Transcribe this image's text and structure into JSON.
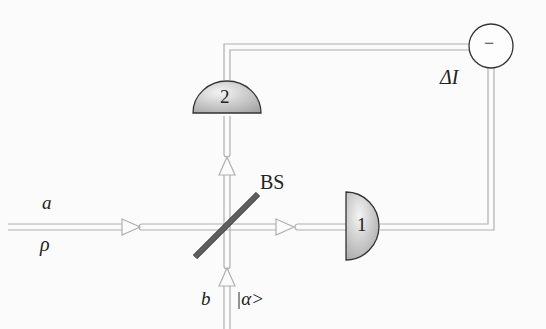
{
  "diagram": {
    "labels": {
      "input_a": "a",
      "input_rho": "ρ",
      "input_b": "b",
      "input_alpha": "|α>",
      "beam_splitter": "BS",
      "detector_1": "1",
      "detector_2": "2",
      "subtractor": "−",
      "output": "ΔI"
    },
    "colors": {
      "background": "#fbfbfb",
      "beam_line": "#b0b0b0",
      "detector_fill_light": "#f2f2f2",
      "detector_fill_dark": "#a8a8a8",
      "outline": "#333333",
      "splitter": "#7a7a7a"
    },
    "components": [
      {
        "id": "input-a",
        "type": "signal-input",
        "label": "a",
        "sublabel": "ρ"
      },
      {
        "id": "input-b",
        "type": "local-oscillator",
        "label": "b",
        "sublabel": "|α>"
      },
      {
        "id": "bs",
        "type": "beam-splitter",
        "label": "BS"
      },
      {
        "id": "det1",
        "type": "photodetector",
        "label": "1"
      },
      {
        "id": "det2",
        "type": "photodetector",
        "label": "2"
      },
      {
        "id": "sub",
        "type": "subtractor",
        "label": "−",
        "output": "ΔI"
      }
    ]
  }
}
